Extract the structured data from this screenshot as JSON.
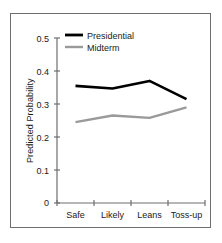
{
  "chart_data": {
    "type": "line",
    "title": "",
    "xlabel": "",
    "ylabel": "Predicted Probability",
    "categories": [
      "Safe",
      "Likely",
      "Leans",
      "Toss-up"
    ],
    "ylim": [
      0,
      0.5
    ],
    "yticks": [
      "0",
      "0.1",
      "0.2",
      "0.3",
      "0.4",
      "0.5"
    ],
    "ytick_values": [
      0,
      0.1,
      0.2,
      0.3,
      0.4,
      0.5
    ],
    "grid": false,
    "legend_position": "top-center",
    "series": [
      {
        "name": "Presidential",
        "color": "#000000",
        "values": [
          0.355,
          0.347,
          0.37,
          0.315
        ]
      },
      {
        "name": "Midterm",
        "color": "#9a9a9a",
        "values": [
          0.245,
          0.265,
          0.258,
          0.29
        ]
      }
    ]
  },
  "figure": {
    "frame_color": "#6e6e6e",
    "axis_color": "#6e6e6e",
    "background": "#ffffff"
  }
}
